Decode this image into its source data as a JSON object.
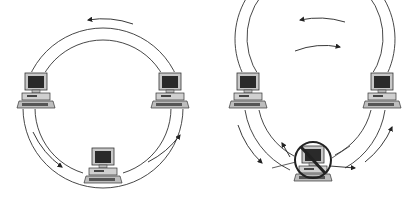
{
  "diagram": {
    "type": "ring-network-topology",
    "panels": [
      {
        "id": "normal-ring",
        "description": "Dual counter-rotating ring with three computers",
        "nodes": [
          "left-computer",
          "right-computer",
          "bottom-computer"
        ],
        "status": "all nodes operational"
      },
      {
        "id": "failed-ring",
        "description": "Dual ring wrapping around a failed node",
        "nodes": [
          "left-computer",
          "right-computer",
          "bottom-computer-failed"
        ],
        "status": "bottom node failed (prohibited sign)"
      }
    ],
    "colors": {
      "line": "#333333",
      "screen": "#2a2a2a",
      "body": "#bdbdbd",
      "background": "#ffffff"
    }
  }
}
